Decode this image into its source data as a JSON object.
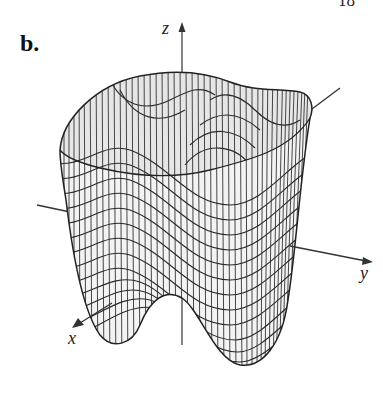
{
  "figure": {
    "page_number": "18",
    "part_label": "b.",
    "axes": {
      "x_label": "x",
      "y_label": "y",
      "z_label": "z"
    },
    "surface": {
      "type": "wireframe-3d-surface",
      "description": "Double-well surface with two lobes at the bottom and a wavy rim at the top"
    },
    "colors": {
      "line": "#222222",
      "surface_fill": "#f2f2f2",
      "inner_fill": "#e4e4e4"
    }
  }
}
